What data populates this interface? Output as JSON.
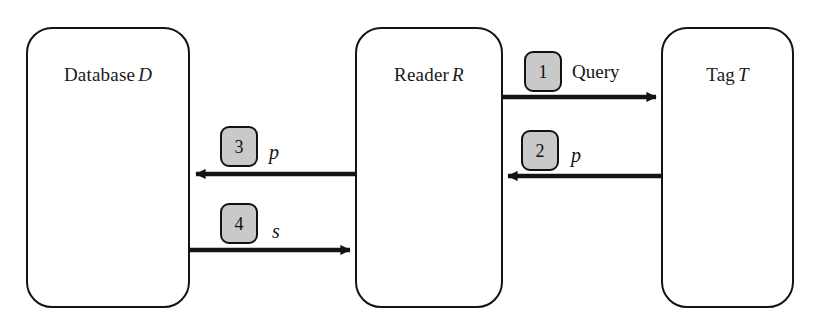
{
  "diagram": {
    "background_color": "#ffffff",
    "stroke_color": "#141414",
    "badge_fill_color": "#c9c9c9",
    "tag_antenna_color": "#d9d9d9",
    "tag_chip_color": "#9a9a9a",
    "reader_icon_fill": "#efefef"
  },
  "entities": [
    {
      "id": "database",
      "name_plain": "Database",
      "symbol": "D",
      "icon": "database-cylinder-icon"
    },
    {
      "id": "reader",
      "name_plain": "Reader",
      "symbol": "R",
      "icon": "rfid-reader-icon"
    },
    {
      "id": "tag",
      "name_plain": "Tag",
      "symbol": "T",
      "icon": "rfid-tag-antenna-icon"
    }
  ],
  "messages": [
    {
      "step": "1",
      "label": "Query",
      "label_italic": false,
      "from": "reader",
      "to": "tag",
      "direction": "right"
    },
    {
      "step": "2",
      "label": "p",
      "label_italic": true,
      "from": "tag",
      "to": "reader",
      "direction": "left"
    },
    {
      "step": "3",
      "label": "p",
      "label_italic": true,
      "from": "reader",
      "to": "database",
      "direction": "left"
    },
    {
      "step": "4",
      "label": "s",
      "label_italic": true,
      "from": "database",
      "to": "reader",
      "direction": "right"
    }
  ]
}
